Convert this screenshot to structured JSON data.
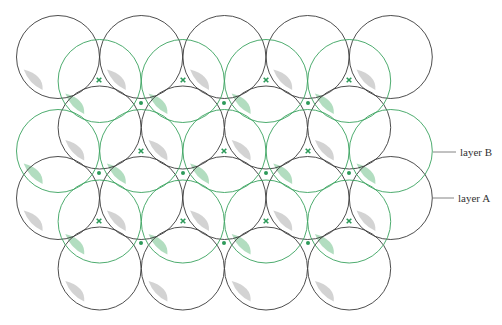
{
  "diagram": {
    "title": "",
    "colors": {
      "layer_a": "#3a3a3a",
      "layer_b": "#3aa35f",
      "marker": "#2e9a5a",
      "shade_a": "#c8c8c8",
      "shade_b": "#9fd4b0"
    },
    "layers": [
      {
        "id": "layer-a",
        "label": "layer A",
        "rows": [
          {
            "count": 5,
            "offset": false
          },
          {
            "count": 4,
            "offset": true
          },
          {
            "count": 5,
            "offset": false
          },
          {
            "count": 4,
            "offset": true
          }
        ]
      },
      {
        "id": "layer-b",
        "label": "layer B",
        "rows": [
          {
            "count": 4,
            "offset": true
          },
          {
            "count": 5,
            "offset": false
          },
          {
            "count": 4,
            "offset": true
          }
        ]
      }
    ],
    "markers": {
      "cross_label": "hole-type-x",
      "dot_label": "hole-type-dot"
    }
  }
}
